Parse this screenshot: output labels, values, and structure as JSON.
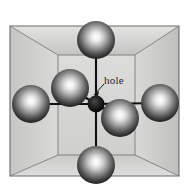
{
  "figure": {
    "type": "crystal-unit-cell-diagram",
    "title": "",
    "annotations": [
      {
        "id": "hole",
        "label": "hole",
        "x": 104,
        "y": 74,
        "leader_from": [
          103,
          85
        ],
        "leader_to": [
          93,
          95
        ]
      }
    ],
    "background_color": "#ffffff",
    "cube": {
      "face_fill": "#d6d6d4",
      "top_fill": "#c9c9c7",
      "left_fill": "#c2c2c0",
      "bottom_fill": "#cfcfcd",
      "right_fill": "#bfbfbd",
      "edge_color": "#6e6e6e",
      "outer_edge_color": "#5a5a5a",
      "front_face": [
        [
          58,
          55
        ],
        [
          135,
          55
        ],
        [
          135,
          155
        ],
        [
          58,
          155
        ]
      ],
      "back_face": [
        [
          10,
          26
        ],
        [
          179,
          26
        ],
        [
          179,
          176
        ],
        [
          10,
          176
        ]
      ]
    },
    "atoms": [
      {
        "id": "atom-top",
        "cx": 96,
        "cy": 40,
        "r": 19,
        "color": "#2a2a2a"
      },
      {
        "id": "atom-bottom",
        "cx": 96,
        "cy": 165,
        "r": 19,
        "color": "#2a2a2a"
      },
      {
        "id": "atom-left",
        "cx": 31,
        "cy": 104,
        "r": 19,
        "color": "#2a2a2a"
      },
      {
        "id": "atom-right",
        "cx": 160,
        "cy": 103,
        "r": 19,
        "color": "#2a2a2a"
      },
      {
        "id": "atom-back-upper",
        "cx": 70,
        "cy": 88,
        "r": 19,
        "color": "#2a2a2a"
      },
      {
        "id": "atom-front-lower",
        "cx": 120,
        "cy": 118,
        "r": 19,
        "color": "#2a2a2a"
      },
      {
        "id": "atom-hole-center",
        "cx": 96,
        "cy": 104,
        "r": 8,
        "color": "#111111"
      }
    ],
    "bonds": [
      {
        "id": "bond-top",
        "x1": 96,
        "y1": 104,
        "x2": 96,
        "y2": 40
      },
      {
        "id": "bond-bottom",
        "x1": 96,
        "y1": 104,
        "x2": 96,
        "y2": 165
      },
      {
        "id": "bond-left",
        "x1": 96,
        "y1": 104,
        "x2": 31,
        "y2": 104
      },
      {
        "id": "bond-right",
        "x1": 96,
        "y1": 104,
        "x2": 160,
        "y2": 103
      },
      {
        "id": "bond-back-upper",
        "x1": 96,
        "y1": 104,
        "x2": 70,
        "y2": 88
      },
      {
        "id": "bond-front-lower",
        "x1": 96,
        "y1": 104,
        "x2": 120,
        "y2": 118
      }
    ]
  }
}
